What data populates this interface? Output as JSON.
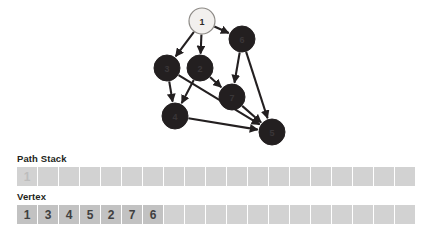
{
  "graph": {
    "label": "directed-graph-traversal-diagram",
    "node_colors": {
      "visited_current": "#f2f0ee",
      "default": "#231f20",
      "edge": "#231f20"
    },
    "nodes": [
      {
        "id": "1",
        "label": "1",
        "cx": 202,
        "cy": 21,
        "r": 13,
        "style": "light"
      },
      {
        "id": "6",
        "label": "6",
        "cx": 242,
        "cy": 39,
        "r": 13,
        "style": "dark"
      },
      {
        "id": "3",
        "label": "3",
        "cx": 167,
        "cy": 68,
        "r": 13,
        "style": "dark"
      },
      {
        "id": "2",
        "label": "2",
        "cx": 200,
        "cy": 68,
        "r": 13,
        "style": "dark"
      },
      {
        "id": "7",
        "label": "7",
        "cx": 232,
        "cy": 97,
        "r": 13,
        "style": "dark"
      },
      {
        "id": "4",
        "label": "4",
        "cx": 175,
        "cy": 116,
        "r": 13,
        "style": "dark"
      },
      {
        "id": "5",
        "label": "5",
        "cx": 272,
        "cy": 132,
        "r": 13,
        "style": "dark"
      }
    ],
    "edges": [
      {
        "from": "1",
        "to": "3"
      },
      {
        "from": "1",
        "to": "2"
      },
      {
        "from": "1",
        "to": "6"
      },
      {
        "from": "3",
        "to": "4"
      },
      {
        "from": "2",
        "to": "4"
      },
      {
        "from": "2",
        "to": "7"
      },
      {
        "from": "3",
        "to": "5"
      },
      {
        "from": "4",
        "to": "5"
      },
      {
        "from": "7",
        "to": "5"
      },
      {
        "from": "6",
        "to": "7"
      },
      {
        "from": "6",
        "to": "5"
      }
    ]
  },
  "path_stack": {
    "title": "Path Stack",
    "cell_count": 19,
    "cells": [
      "1",
      "",
      "",
      "",
      "",
      "",
      "",
      "",
      "",
      "",
      "",
      "",
      "",
      "",
      "",
      "",
      "",
      "",
      ""
    ],
    "filled_style": "faint"
  },
  "vertex": {
    "title": "Vertex",
    "cell_count": 19,
    "cells": [
      "1",
      "3",
      "4",
      "5",
      "2",
      "7",
      "6",
      "",
      "",
      "",
      "",
      "",
      "",
      "",
      "",
      "",
      "",
      "",
      ""
    ],
    "filled_style": "strong"
  },
  "colors": {
    "cell_empty": "#d2d2d2",
    "cell_filled": "#c2c2c2",
    "text_dark": "#231f20",
    "text_faint": "#bdbdbd",
    "background": "#ffffff"
  }
}
